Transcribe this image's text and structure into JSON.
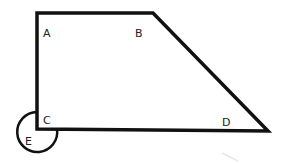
{
  "diagram": {
    "type": "geometry-figure",
    "shape": "trapezoid",
    "stroke_color": "#111111",
    "background": "#ffffff",
    "vertices": {
      "A": {
        "label": "A",
        "x": 37,
        "y": 13
      },
      "B": {
        "label": "B",
        "x": 153,
        "y": 13
      },
      "D": {
        "label": "D",
        "x": 268,
        "y": 131
      },
      "C": {
        "label": "C",
        "x": 37,
        "y": 129
      }
    },
    "circle": {
      "label": "E",
      "cx": 37,
      "cy": 132,
      "r": 20
    },
    "labels": {
      "A": "A",
      "B": "B",
      "C": "C",
      "D": "D",
      "E": "E"
    }
  }
}
